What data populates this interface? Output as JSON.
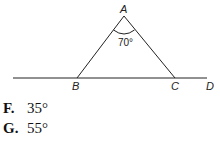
{
  "diagram": {
    "points": {
      "A": {
        "label": "A",
        "x": 124,
        "y": 16
      },
      "B": {
        "label": "B",
        "x": 77,
        "y": 78
      },
      "C": {
        "label": "C",
        "x": 175,
        "y": 78
      },
      "D": {
        "label": "D",
        "x": 207,
        "y": 78
      }
    },
    "angle_label": "70°",
    "line_color": "#222222"
  },
  "choices": [
    {
      "letter": "F.",
      "value": "35°"
    },
    {
      "letter": "G.",
      "value": "55°"
    }
  ]
}
